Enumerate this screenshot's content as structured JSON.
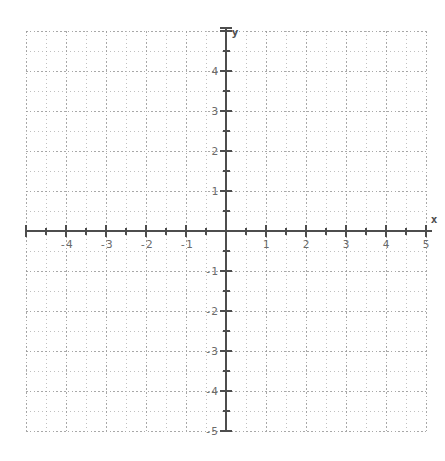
{
  "chart_data": {
    "type": "scatter",
    "title": "",
    "subtitle": "",
    "xlabel": "x",
    "ylabel": "y",
    "xlim": [
      -5,
      5
    ],
    "ylim": [
      -5,
      5
    ],
    "grid": true,
    "grid_style": "dotted",
    "grid_minor_step": 0.5,
    "grid_major_step": 1,
    "legend": null,
    "series": [],
    "x": [],
    "y": [],
    "annotations": [],
    "x_tick_values": [
      -5,
      -4,
      -3,
      -2,
      -1,
      0,
      1,
      2,
      3,
      4,
      5
    ],
    "y_tick_values": [
      -5,
      -4,
      -3,
      -2,
      -1,
      0,
      1,
      2,
      3,
      4,
      5
    ],
    "x_tick_labels": [
      "",
      "-4",
      "-3",
      "-2",
      "-1",
      "",
      "1",
      "2",
      "3",
      "4",
      "5"
    ],
    "y_tick_labels": [
      "-5",
      "-4",
      "-3",
      "-2",
      "-1",
      "",
      "1",
      "2",
      "3",
      "4",
      ""
    ],
    "minor_tick_step": 0.5,
    "origin_label": ""
  },
  "axes": {
    "x_axis_label": "x",
    "y_axis_label": "y"
  },
  "colors": {
    "background": "#ffffff",
    "axis": "#4d4d4d",
    "grid": "#9a9a9a",
    "tick_label": "#6b6b6b",
    "axis_label": "#4d4d4d"
  },
  "geometry": {
    "origin_x_px": 226,
    "origin_y_px": 231,
    "unit_px": 40,
    "grid_left_px": 26,
    "grid_right_px": 426,
    "grid_top_px": 31,
    "grid_bottom_px": 431
  }
}
